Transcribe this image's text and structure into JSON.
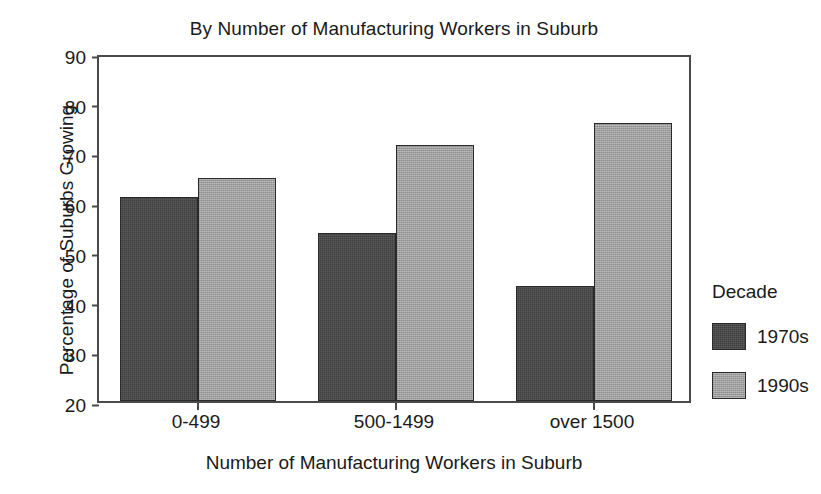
{
  "chart_data": {
    "type": "bar",
    "title": "By Number of Manufacturing Workers in Suburb",
    "xlabel": "Number of Manufacturing Workers in Suburb",
    "ylabel": "Percentage of Suburbs Growing",
    "categories": [
      "0-499",
      "500-1499",
      "over 1500"
    ],
    "series": [
      {
        "name": "1970s",
        "color": "#3f3f3f",
        "values": [
          61,
          53.7,
          43.2
        ]
      },
      {
        "name": "1990s",
        "color": "#9e9e9e",
        "values": [
          64.8,
          71.5,
          76
        ]
      }
    ],
    "ylim": [
      20,
      90
    ],
    "yticks": [
      90,
      80,
      70,
      60,
      50,
      40,
      30,
      20
    ],
    "grid": false,
    "legend": {
      "title": "Decade",
      "position": "right"
    }
  }
}
